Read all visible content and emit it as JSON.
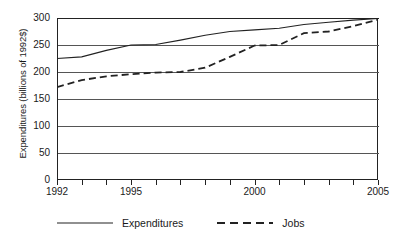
{
  "chart_data": {
    "type": "line",
    "title": "",
    "xlabel": "",
    "ylabel": "Expenditures (billions of 1992$)",
    "xlim": [
      1992,
      2005
    ],
    "ylim": [
      0,
      300
    ],
    "grid": true,
    "legend_position": "bottom",
    "x": [
      1992,
      1993,
      1994,
      1995,
      1996,
      1997,
      1998,
      1999,
      2000,
      2001,
      2002,
      2003,
      2004,
      2005
    ],
    "y_ticks": [
      0,
      50,
      100,
      150,
      200,
      250,
      300
    ],
    "y_tick_labels": [
      "0",
      "50",
      "100",
      "150",
      "200",
      "250",
      "300"
    ],
    "x_ticks": [
      1992,
      1993,
      1994,
      1995,
      1996,
      1997,
      1998,
      1999,
      2000,
      2001,
      2002,
      2003,
      2004,
      2005
    ],
    "x_tick_labels": [
      "1992",
      "",
      "",
      "1995",
      "",
      "",
      "",
      "",
      "2000",
      "",
      "",
      "",
      "",
      "2005"
    ],
    "series": [
      {
        "name": "Expenditures",
        "style": "solid",
        "color": "#222222",
        "values": [
          225,
          228,
          240,
          250,
          251,
          259,
          268,
          275,
          278,
          281,
          288,
          292,
          296,
          299
        ]
      },
      {
        "name": "Jobs",
        "style": "dashed",
        "color": "#222222",
        "values": [
          172,
          185,
          192,
          196,
          199,
          200,
          208,
          228,
          249,
          250,
          272,
          275,
          285,
          297
        ]
      }
    ]
  },
  "legend": {
    "entries": [
      {
        "label": "Expenditures",
        "style": "solid"
      },
      {
        "label": "Jobs",
        "style": "dashed"
      }
    ]
  },
  "axes": {
    "y_title": "Expenditures (billions of 1992$)"
  }
}
